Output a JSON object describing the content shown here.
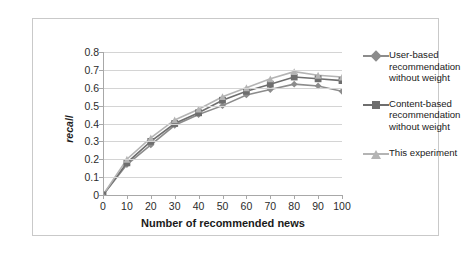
{
  "chart_data": {
    "type": "line",
    "title": "",
    "xlabel": "Number of recommended news",
    "ylabel": "recall",
    "x": [
      0,
      10,
      20,
      30,
      40,
      50,
      60,
      70,
      80,
      90,
      100
    ],
    "xlim": [
      0,
      100
    ],
    "ylim": [
      0,
      0.8
    ],
    "ytick_labels": [
      "0.8",
      "0.7",
      "0.6",
      "0.5",
      "0.4",
      "0.3",
      "0.2",
      "0.1",
      "0"
    ],
    "ytick_values": [
      0.8,
      0.7,
      0.6,
      0.5,
      0.4,
      0.3,
      0.2,
      0.1,
      0
    ],
    "xtick_labels": [
      "0",
      "10",
      "20",
      "30",
      "40",
      "50",
      "60",
      "70",
      "80",
      "90",
      "100"
    ],
    "grid": true,
    "legend_position": "right",
    "series": [
      {
        "name": "User-based recommendation without weight",
        "marker": "diamond",
        "color": "#8c8c8c",
        "values": [
          0,
          0.17,
          0.28,
          0.39,
          0.45,
          0.5,
          0.56,
          0.59,
          0.62,
          0.61,
          0.58
        ]
      },
      {
        "name": "Content-based recommendation without weight",
        "marker": "square",
        "color": "#6e6e6e",
        "values": [
          0,
          0.18,
          0.3,
          0.4,
          0.46,
          0.53,
          0.58,
          0.62,
          0.66,
          0.65,
          0.64
        ]
      },
      {
        "name": "This experiment",
        "marker": "triangle",
        "color": "#b4b4b4",
        "values": [
          0,
          0.2,
          0.32,
          0.42,
          0.48,
          0.55,
          0.6,
          0.65,
          0.69,
          0.67,
          0.66
        ]
      }
    ]
  },
  "legend": {
    "items": [
      {
        "label": "User-based\nrecommendation\nwithout weight"
      },
      {
        "label": "Content-based\nrecommendation\nwithout weight"
      },
      {
        "label": "This experiment"
      }
    ]
  },
  "colors": {
    "series_user_based": "#8c8c8c",
    "series_content_based": "#6e6e6e",
    "series_this_experiment": "#b4b4b4",
    "gridline": "#d4d4d4",
    "axis": "#a8a8a8",
    "border": "#c9c9c9",
    "text": "#1a1a1a"
  }
}
